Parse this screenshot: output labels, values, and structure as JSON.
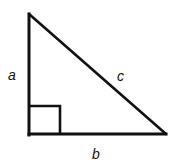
{
  "diagram": {
    "labels": {
      "a": "a",
      "b": "b",
      "c": "c"
    },
    "vertices": {
      "top": [
        29,
        14
      ],
      "right_angle": [
        29,
        134
      ],
      "right": [
        166,
        134
      ]
    },
    "right_angle_marker_size": 31,
    "stroke_color": "#111111",
    "background": "#ffffff"
  }
}
